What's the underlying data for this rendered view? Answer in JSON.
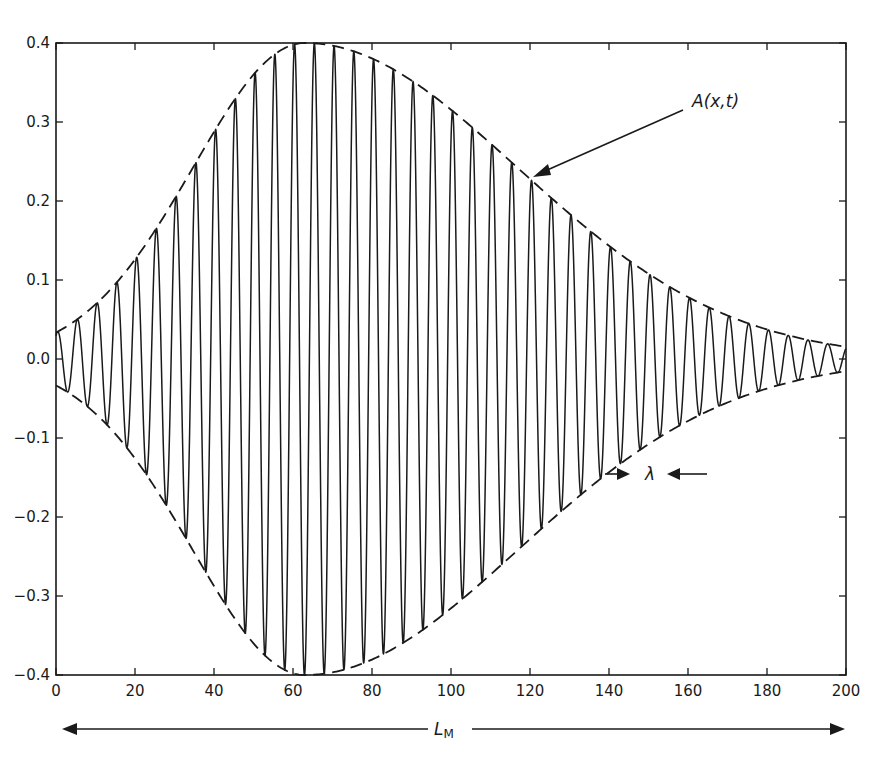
{
  "chart_data": {
    "type": "line",
    "title": "",
    "xlabel": "",
    "ylabel": "",
    "xlim": [
      0,
      200
    ],
    "ylim": [
      -0.4,
      0.4
    ],
    "grid": false,
    "legend": null,
    "x_ticks": [
      0,
      20,
      40,
      60,
      80,
      100,
      120,
      140,
      160,
      180,
      200
    ],
    "x_tick_labels": [
      "0",
      "20",
      "40",
      "60",
      "80",
      "100",
      "120",
      "140",
      "160",
      "180",
      "200"
    ],
    "y_ticks": [
      0.4,
      0.3,
      0.2,
      0.1,
      0.0,
      -0.1,
      -0.2,
      -0.3,
      -0.4
    ],
    "y_tick_labels": [
      "0.4",
      "0.3",
      "0.2",
      "0.1",
      "0.0",
      "−0.1",
      "−0.2",
      "−0.3",
      "−0.4"
    ],
    "series": [
      {
        "name": "wave packet",
        "style": "solid",
        "description": "carrier oscillation modulated by envelope A(x,t)",
        "carrier_wavelength": 5.0,
        "carrier_peak_phase_x": 60.4
      },
      {
        "name": "envelope +A(x,t)",
        "style": "dashed",
        "peak_x": 63,
        "peak_value": 0.4,
        "sigma_left": 40,
        "sigma_right": 76,
        "sample_x": [
          0,
          20,
          40,
          63,
          80,
          100,
          120,
          140,
          160,
          180,
          200
        ],
        "sample_values": [
          0.035,
          0.125,
          0.288,
          0.4,
          0.38,
          0.315,
          0.228,
          0.143,
          0.079,
          0.038,
          0.016
        ]
      },
      {
        "name": "envelope −A(x,t)",
        "style": "dashed",
        "sample_x": [
          0,
          20,
          40,
          63,
          80,
          100,
          120,
          140,
          160,
          180,
          200
        ],
        "sample_values": [
          -0.035,
          -0.125,
          -0.288,
          -0.4,
          -0.38,
          -0.315,
          -0.228,
          -0.143,
          -0.079,
          -0.038,
          -0.016
        ]
      }
    ],
    "annotations": [
      {
        "text": "A(x,t)",
        "type": "label-with-arrow",
        "label_pos": [
          174,
          0.325
        ],
        "arrow_to": [
          121,
          0.233
        ]
      },
      {
        "text": "λ",
        "type": "wavelength-marker",
        "x": 150,
        "y": -0.155
      },
      {
        "text": "L",
        "subscript": "M",
        "type": "span-arrow",
        "from_x": 0,
        "to_x": 200
      }
    ]
  },
  "labels": {
    "envelope": "A(x,t)",
    "wavelength": "λ",
    "length_main": "L",
    "length_sub": "M"
  },
  "colors": {
    "ink": "#1a1a1a",
    "background": "#ffffff"
  }
}
